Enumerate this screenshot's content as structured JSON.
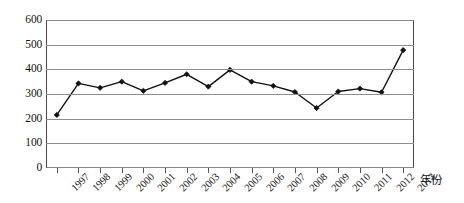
{
  "chart_data": {
    "type": "line",
    "title": "",
    "xlabel": "年份",
    "ylabel": "",
    "categories": [
      "1997",
      "1998",
      "1999",
      "2000",
      "2001",
      "2002",
      "2003",
      "2004",
      "2005",
      "2006",
      "2007",
      "2008",
      "2009",
      "2010",
      "2011",
      "2012",
      "2013"
    ],
    "values": [
      215,
      343,
      325,
      350,
      313,
      345,
      380,
      330,
      398,
      350,
      333,
      308,
      243,
      310,
      322,
      307,
      478
    ],
    "series": [
      {
        "name": "series-1",
        "values": [
          215,
          343,
          325,
          350,
          313,
          345,
          380,
          330,
          398,
          350,
          333,
          308,
          243,
          310,
          322,
          307,
          478
        ]
      }
    ],
    "ylim": [
      0,
      600
    ],
    "yticks": [
      0,
      100,
      200,
      300,
      400,
      500,
      600
    ],
    "ytick_labels": [
      "0",
      "100",
      "200",
      "300",
      "400",
      "500",
      "600"
    ],
    "grid": true,
    "legend": false,
    "legend_position": "none",
    "marker": "diamond",
    "line_color": "#111111",
    "marker_color": "#111111",
    "grid_color": "#8d8d8d",
    "axis_color": "#4a4a4a",
    "background_color": "#ffffff"
  },
  "axis": {
    "x_axis_title": "年份",
    "y_axis_title": ""
  }
}
